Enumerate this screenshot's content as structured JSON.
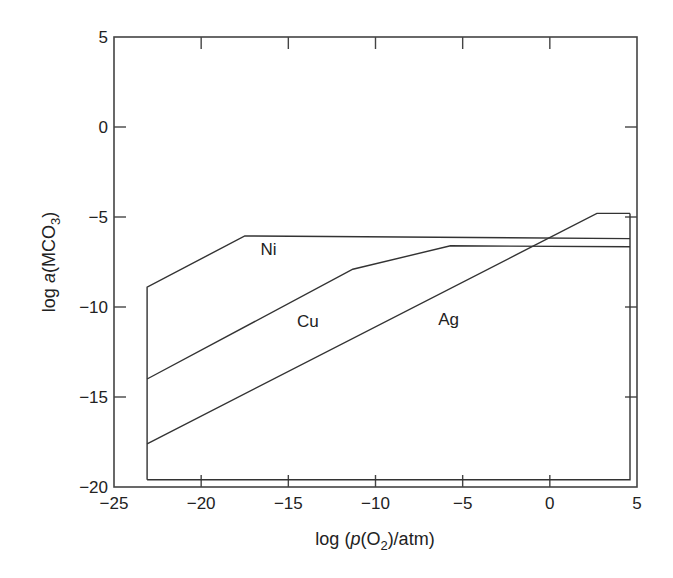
{
  "chart_data": {
    "type": "line",
    "title": "",
    "xlabel": "log (p(O2)/atm)",
    "ylabel": "log a(MCO3)",
    "xlim": [
      -25,
      5
    ],
    "ylim": [
      -20,
      5
    ],
    "grid": false,
    "x_ticks": [
      -25,
      -20,
      -15,
      -10,
      -5,
      0,
      5
    ],
    "y_ticks": [
      5,
      0,
      -5,
      -10,
      -15,
      -20
    ],
    "x_tick_labels": [
      "−25",
      "−20",
      "−15",
      "−10",
      "−5",
      "0",
      "5"
    ],
    "y_tick_labels": [
      "5",
      "0",
      "−5",
      "−10",
      "−15",
      "−20"
    ],
    "series": [
      {
        "name": "Ni",
        "points": [
          [
            -23.1,
            -19.6
          ],
          [
            -23.1,
            -8.9
          ],
          [
            -17.5,
            -6.05
          ],
          [
            4.6,
            -6.2
          ]
        ]
      },
      {
        "name": "Cu",
        "points": [
          [
            -23.1,
            -14.0
          ],
          [
            -11.3,
            -7.9
          ],
          [
            -5.7,
            -6.6
          ],
          [
            4.6,
            -6.65
          ]
        ]
      },
      {
        "name": "Ag",
        "points": [
          [
            -23.1,
            -17.6
          ],
          [
            2.7,
            -4.8
          ],
          [
            4.6,
            -4.8
          ]
        ]
      },
      {
        "name": "boundary",
        "points": [
          [
            -23.1,
            -19.6
          ],
          [
            4.6,
            -19.6
          ],
          [
            4.6,
            -4.8
          ]
        ]
      }
    ],
    "annotations": [
      {
        "text": "Ni",
        "x": -16.6,
        "y": -7.1
      },
      {
        "text": "Cu",
        "x": -14.5,
        "y": -11.1
      },
      {
        "text": "Ag",
        "x": -6.4,
        "y": -11.0
      }
    ]
  },
  "labels": {
    "xlabel_prefix": "log (",
    "xlabel_p": "p",
    "xlabel_mid": "(O",
    "xlabel_sub": "2",
    "xlabel_suffix": ")/atm)",
    "ylabel_prefix": "log ",
    "ylabel_a": "a",
    "ylabel_mid": "(MCO",
    "ylabel_sub": "3",
    "ylabel_suffix": ")"
  }
}
